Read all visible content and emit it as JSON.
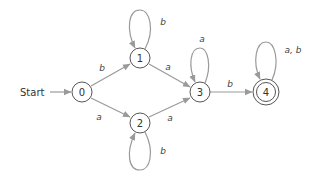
{
  "diagram": {
    "type": "finite-automaton",
    "start_label": "Start",
    "start_state": "0",
    "states": [
      {
        "id": "0",
        "label": "0",
        "accepting": false
      },
      {
        "id": "1",
        "label": "1",
        "accepting": false
      },
      {
        "id": "2",
        "label": "2",
        "accepting": false
      },
      {
        "id": "3",
        "label": "3",
        "accepting": false
      },
      {
        "id": "4",
        "label": "4",
        "accepting": true
      }
    ],
    "transitions": [
      {
        "from": "0",
        "to": "1",
        "label": "b"
      },
      {
        "from": "0",
        "to": "2",
        "label": "a"
      },
      {
        "from": "1",
        "to": "1",
        "label": "b"
      },
      {
        "from": "1",
        "to": "3",
        "label": "a"
      },
      {
        "from": "2",
        "to": "2",
        "label": "b"
      },
      {
        "from": "2",
        "to": "3",
        "label": "a"
      },
      {
        "from": "3",
        "to": "3",
        "label": "a"
      },
      {
        "from": "3",
        "to": "4",
        "label": "b"
      },
      {
        "from": "4",
        "to": "4",
        "label": "a, b"
      }
    ]
  }
}
